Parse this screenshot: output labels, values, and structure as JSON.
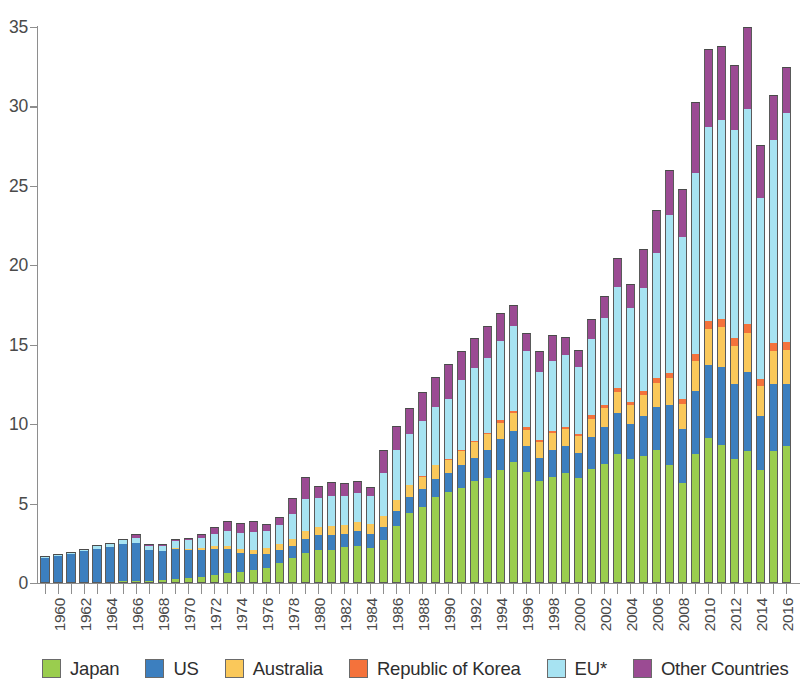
{
  "chart_data": {
    "type": "bar",
    "subtype": "stacked-vertical",
    "title": "",
    "subtitle": "",
    "xlabel": "",
    "ylabel": "",
    "ylim": [
      0,
      35
    ],
    "yticks": [
      0,
      5,
      10,
      15,
      20,
      25,
      30,
      35
    ],
    "ytick_labels": [
      "0",
      "5",
      "10",
      "15",
      "20",
      "25",
      "30",
      "35"
    ],
    "grid": false,
    "legend_position": "bottom",
    "xtick_label_rotation": -90,
    "xtick_label_interval": 2,
    "x": [
      1960,
      1961,
      1962,
      1963,
      1964,
      1965,
      1966,
      1967,
      1968,
      1969,
      1970,
      1971,
      1972,
      1973,
      1974,
      1975,
      1976,
      1977,
      1978,
      1979,
      1980,
      1981,
      1982,
      1983,
      1984,
      1985,
      1986,
      1987,
      1988,
      1989,
      1990,
      1991,
      1992,
      1993,
      1994,
      1995,
      1996,
      1997,
      1998,
      1999,
      2000,
      2001,
      2002,
      2003,
      2004,
      2005,
      2006,
      2007,
      2008,
      2009,
      2010,
      2011,
      2012,
      2013,
      2014,
      2015,
      2016,
      2017
    ],
    "categories": [
      "1960",
      "1961",
      "1962",
      "1963",
      "1964",
      "1965",
      "1966",
      "1967",
      "1968",
      "1969",
      "1970",
      "1971",
      "1972",
      "1973",
      "1974",
      "1975",
      "1976",
      "1977",
      "1978",
      "1979",
      "1980",
      "1981",
      "1982",
      "1983",
      "1984",
      "1985",
      "1986",
      "1987",
      "1988",
      "1989",
      "1990",
      "1991",
      "1992",
      "1993",
      "1994",
      "1995",
      "1996",
      "1997",
      "1998",
      "1999",
      "2000",
      "2001",
      "2002",
      "2003",
      "2004",
      "2005",
      "2006",
      "2007",
      "2008",
      "2009",
      "2010",
      "2011",
      "2012",
      "2013",
      "2014",
      "2015",
      "2016",
      "2017"
    ],
    "visible_xtick_labels": [
      "1960",
      "1962",
      "1964",
      "1966",
      "1968",
      "1970",
      "1972",
      "1974",
      "1976",
      "1978",
      "1980",
      "1982",
      "1984",
      "1986",
      "1988",
      "1990",
      "1992",
      "1994",
      "1996",
      "1998",
      "2000",
      "2002",
      "2004",
      "2006",
      "2008",
      "2010",
      "2012",
      "2014",
      "2016"
    ],
    "series": [
      {
        "name": "Japan",
        "color": "#9ACD4E",
        "values": [
          0.0,
          0.0,
          0.0,
          0.0,
          0.05,
          0.05,
          0.1,
          0.1,
          0.15,
          0.2,
          0.25,
          0.3,
          0.4,
          0.5,
          0.6,
          0.7,
          0.8,
          0.95,
          1.25,
          1.6,
          1.9,
          2.05,
          2.1,
          2.25,
          2.3,
          2.2,
          2.7,
          3.6,
          4.4,
          4.8,
          5.4,
          5.7,
          6.0,
          6.4,
          6.6,
          7.1,
          7.6,
          7.0,
          6.4,
          6.7,
          6.9,
          6.6,
          7.2,
          7.5,
          8.1,
          7.8,
          8.0,
          8.4,
          7.4,
          6.3,
          8.1,
          9.1,
          8.7,
          7.8,
          8.7,
          7.1,
          8.3,
          8.6
        ]
      },
      {
        "name": "US",
        "color": "#3C7FBF",
        "values": [
          1.6,
          1.7,
          1.85,
          2.0,
          2.1,
          2.2,
          2.35,
          2.45,
          1.95,
          1.8,
          1.9,
          1.8,
          1.7,
          1.65,
          1.55,
          1.2,
          1.0,
          0.9,
          0.8,
          0.75,
          0.9,
          0.95,
          0.95,
          0.85,
          0.95,
          0.9,
          0.85,
          0.95,
          1.0,
          1.1,
          1.15,
          1.2,
          1.4,
          1.5,
          1.75,
          1.95,
          2.0,
          1.6,
          1.5,
          1.7,
          1.7,
          1.6,
          2.0,
          2.3,
          2.6,
          2.2,
          2.5,
          2.7,
          3.8,
          3.4,
          4.0,
          4.6,
          4.9,
          4.7,
          5.2,
          3.4,
          4.2,
          3.9
        ]
      },
      {
        "name": "Australia",
        "color": "#FAC85A",
        "values": [
          0.0,
          0.0,
          0.0,
          0.0,
          0.0,
          0.0,
          0.0,
          0.0,
          0.0,
          0.0,
          0.05,
          0.05,
          0.1,
          0.15,
          0.2,
          0.25,
          0.3,
          0.35,
          0.4,
          0.45,
          0.5,
          0.5,
          0.55,
          0.55,
          0.6,
          0.6,
          0.65,
          0.7,
          0.75,
          0.8,
          0.85,
          0.85,
          0.9,
          0.95,
          1.0,
          1.05,
          1.1,
          1.05,
          1.0,
          1.05,
          1.1,
          1.05,
          1.15,
          1.2,
          1.3,
          1.2,
          1.35,
          1.5,
          1.7,
          1.6,
          1.9,
          2.3,
          2.5,
          2.4,
          2.6,
          1.9,
          2.1,
          2.2
        ]
      },
      {
        "name": "Republic of Korea",
        "color": "#F4723B",
        "values": [
          0.0,
          0.0,
          0.0,
          0.0,
          0.0,
          0.0,
          0.0,
          0.0,
          0.0,
          0.0,
          0.0,
          0.0,
          0.0,
          0.0,
          0.0,
          0.0,
          0.0,
          0.0,
          0.0,
          0.0,
          0.0,
          0.0,
          0.0,
          0.0,
          0.0,
          0.0,
          0.0,
          0.0,
          0.05,
          0.05,
          0.05,
          0.05,
          0.1,
          0.1,
          0.1,
          0.15,
          0.15,
          0.15,
          0.1,
          0.15,
          0.15,
          0.15,
          0.2,
          0.2,
          0.25,
          0.2,
          0.25,
          0.3,
          0.35,
          0.3,
          0.4,
          0.5,
          0.55,
          0.5,
          0.6,
          0.45,
          0.5,
          0.5
        ]
      },
      {
        "name": "EU*",
        "color": "#A7E3F2",
        "values": [
          0.1,
          0.1,
          0.1,
          0.15,
          0.2,
          0.25,
          0.25,
          0.3,
          0.25,
          0.35,
          0.45,
          0.55,
          0.65,
          0.8,
          0.95,
          1.0,
          1.1,
          1.1,
          1.2,
          1.55,
          2.0,
          1.85,
          1.9,
          1.85,
          1.8,
          1.75,
          2.7,
          3.1,
          3.2,
          3.45,
          3.6,
          3.8,
          4.4,
          4.6,
          4.7,
          5.0,
          5.3,
          4.8,
          4.3,
          4.4,
          4.5,
          4.2,
          4.8,
          5.5,
          6.4,
          5.9,
          6.5,
          7.9,
          9.9,
          10.2,
          11.4,
          12.2,
          12.5,
          13.1,
          14.2,
          11.4,
          12.8,
          14.4
        ]
      },
      {
        "name": "Other Countries",
        "color": "#9B4B93",
        "values": [
          0.0,
          0.0,
          0.0,
          0.0,
          0.0,
          0.0,
          0.05,
          0.25,
          0.1,
          0.1,
          0.1,
          0.15,
          0.25,
          0.4,
          0.6,
          0.65,
          0.7,
          0.4,
          0.5,
          1.0,
          1.35,
          0.75,
          0.85,
          0.8,
          0.75,
          0.6,
          1.45,
          1.55,
          1.65,
          1.85,
          1.9,
          2.2,
          1.8,
          1.9,
          2.0,
          1.75,
          1.35,
          1.15,
          1.3,
          1.6,
          1.15,
          1.1,
          1.25,
          1.4,
          1.8,
          1.5,
          2.4,
          2.7,
          2.85,
          3.0,
          4.5,
          4.9,
          4.65,
          4.1,
          5.4,
          3.3,
          2.8,
          2.9
        ]
      }
    ],
    "totals": [
      1.7,
      1.8,
      1.95,
      2.15,
      2.35,
      2.5,
      2.75,
      3.1,
      2.45,
      2.45,
      2.75,
      2.85,
      3.1,
      3.5,
      3.9,
      3.8,
      3.9,
      3.7,
      4.15,
      5.35,
      6.7,
      6.15,
      6.35,
      6.3,
      6.4,
      6.05,
      8.35,
      9.9,
      11.05,
      12.05,
      12.95,
      13.8,
      14.6,
      15.45,
      16.15,
      17.0,
      17.5,
      15.75,
      14.6,
      15.6,
      15.5,
      14.7,
      16.6,
      18.1,
      20.45,
      18.8,
      21.0,
      23.5,
      26.0,
      24.8,
      30.3,
      33.6,
      33.8,
      32.6,
      36.7,
      27.55,
      30.7,
      32.5
    ]
  },
  "legend": {
    "items": [
      {
        "label": "Japan",
        "color": "#9ACD4E",
        "icon": "color-swatch"
      },
      {
        "label": "US",
        "color": "#3C7FBF",
        "icon": "color-swatch"
      },
      {
        "label": "Australia",
        "color": "#FAC85A",
        "icon": "color-swatch"
      },
      {
        "label": "Republic of Korea",
        "color": "#F4723B",
        "icon": "color-swatch"
      },
      {
        "label": "EU*",
        "color": "#A7E3F2",
        "icon": "color-swatch"
      },
      {
        "label": "Other Countries",
        "color": "#9B4B93",
        "icon": "color-swatch"
      }
    ]
  }
}
